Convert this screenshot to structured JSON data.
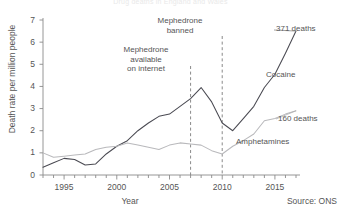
{
  "meta": {
    "top_faint_title": "Drug deaths in England and Wales",
    "source_note": "Source: ONS"
  },
  "chart_data": {
    "type": "line",
    "title": "",
    "xlabel": "Year",
    "ylabel": "Death rate per million people",
    "xlim": [
      1993,
      2017
    ],
    "ylim": [
      0,
      7
    ],
    "xticks": [
      1995,
      2000,
      2005,
      2010,
      2015
    ],
    "yticks": [
      0,
      1,
      2,
      3,
      4,
      5,
      6,
      7
    ],
    "minor_xticks_interval": 1,
    "grid": false,
    "legend": "inline-labels",
    "x": [
      1993,
      1994,
      1995,
      1996,
      1997,
      1998,
      1999,
      2000,
      2001,
      2002,
      2003,
      2004,
      2005,
      2006,
      2007,
      2008,
      2009,
      2010,
      2011,
      2012,
      2013,
      2014,
      2015,
      2016,
      2017
    ],
    "series": [
      {
        "name": "Cocaine",
        "color": "#4a4a52",
        "values": [
          0.35,
          0.55,
          0.75,
          0.7,
          0.45,
          0.5,
          0.95,
          1.3,
          1.55,
          2.0,
          2.35,
          2.65,
          2.75,
          3.1,
          3.45,
          3.95,
          3.3,
          2.35,
          2.0,
          2.55,
          3.1,
          3.95,
          4.55,
          5.5,
          6.5
        ],
        "end_label": "371 deaths",
        "inline_label": "Cocaine"
      },
      {
        "name": "Amphetamines",
        "color": "#b9b9bc",
        "values": [
          1.0,
          0.8,
          0.85,
          0.9,
          0.95,
          1.15,
          1.25,
          1.3,
          1.45,
          1.35,
          1.25,
          1.15,
          1.35,
          1.45,
          1.4,
          1.35,
          1.1,
          0.95,
          1.3,
          1.55,
          1.85,
          2.45,
          2.55,
          2.75,
          2.9
        ],
        "end_label": "160 deaths",
        "inline_label": "Amphetamines"
      }
    ],
    "annotations": [
      {
        "id": "mephedrone-available",
        "text_lines": [
          "Mephedrone",
          "available",
          "on internet"
        ],
        "x_value": 2007,
        "line_style": "dashed"
      },
      {
        "id": "mephedrone-banned",
        "text_lines": [
          "Mephedrone",
          "banned"
        ],
        "x_value": 2010,
        "line_style": "dashed"
      }
    ]
  },
  "axis": {
    "y_tick_labels": [
      "0",
      "1",
      "2",
      "3",
      "4",
      "5",
      "6",
      "7"
    ],
    "x_tick_labels": [
      "1995",
      "2000",
      "2005",
      "2010",
      "2015"
    ]
  },
  "labels": {
    "cocaine": "Cocaine",
    "amphetamines": "Amphetamines",
    "cocaine_deaths": "371 deaths",
    "amphetamines_deaths": "160 deaths",
    "mephedrone_available_1": "Mephedrone",
    "mephedrone_available_2": "available",
    "mephedrone_available_3": "on internet",
    "mephedrone_banned_1": "Mephedrone",
    "mephedrone_banned_2": "banned",
    "year": "Year",
    "ylabel": "Death rate per million people",
    "source": "Source: ONS"
  }
}
